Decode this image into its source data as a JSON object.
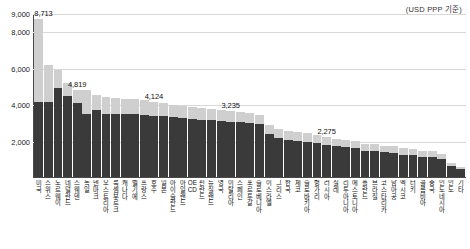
{
  "caption": {
    "unit_note": "(USD PPP 기준)"
  },
  "chart_data": {
    "type": "bar",
    "title": "",
    "subtitle": "",
    "xlabel": "",
    "ylabel": "",
    "unit_note": "(USD PPP 기준)",
    "stacked": true,
    "grid": true,
    "legend_position": "none",
    "ylim": [
      0,
      9000
    ],
    "yticks": [
      2000,
      4000,
      6000,
      8000,
      9000
    ],
    "ytick_labels": [
      "2,000",
      "4,000",
      "6,000",
      "8,000",
      "9,000"
    ],
    "colors": {
      "dark_segment": "#3a3a3a",
      "light_segment": "#cfcfcf",
      "gridline": "#d8d8d8",
      "axis": "#4a4a4a"
    },
    "series": [
      {
        "name": "dark",
        "values": [
          4130,
          4120,
          4900,
          4500,
          4100,
          3500,
          3720,
          3480,
          3460,
          3500,
          3490,
          3440,
          3380,
          3360,
          3300,
          3240,
          3180,
          3150,
          3140,
          3100,
          3050,
          3040,
          2980,
          2900,
          2400,
          2180,
          2050,
          2000,
          1960,
          1900,
          1790,
          1700,
          1640,
          1600,
          1450,
          1420,
          1360,
          1330,
          1240,
          1200,
          1130,
          1090,
          980,
          600,
          420
        ]
      },
      {
        "name": "light",
        "values": [
          4583,
          2080,
          1000,
          700,
          720,
          1319,
          800,
          940,
          910,
          820,
          800,
          790,
          744,
          720,
          700,
          680,
          660,
          640,
          620,
          600,
          580,
          560,
          540,
          520,
          500,
          490,
          470,
          460,
          450,
          440,
          430,
          420,
          410,
          400,
          390,
          380,
          370,
          360,
          350,
          340,
          330,
          320,
          300,
          180,
          120
        ]
      }
    ],
    "totals": [
      8713,
      6200,
      5900,
      5200,
      4819,
      4819,
      4520,
      4420,
      4370,
      4320,
      4290,
      4230,
      4124,
      4080,
      4000,
      3920,
      3840,
      3790,
      3760,
      3700,
      3630,
      3600,
      3520,
      3420,
      2900,
      2670,
      2520,
      2460,
      2410,
      2340,
      2275,
      2120,
      2050,
      2000,
      1840,
      1800,
      1730,
      1690,
      1590,
      1540,
      1460,
      1410,
      1280,
      780,
      540
    ],
    "value_labels": [
      {
        "index": 0,
        "text": "8,713"
      },
      {
        "index": 4,
        "text": "4,819"
      },
      {
        "index": 12,
        "text": "4,124"
      },
      {
        "index": 20,
        "text": "3,235"
      },
      {
        "index": 30,
        "text": "2,275"
      }
    ],
    "categories": [
      "미국",
      "스위스",
      "노르웨이",
      "네덜란드",
      "스웨덴",
      "독일",
      "덴마크",
      "오스트리아",
      "룩셈부르크",
      "캐나다",
      "벨기에",
      "프랑스",
      "호주",
      "일본",
      "아이슬란드",
      "아일랜드",
      "OECD",
      "핀란드",
      "뉴질랜드",
      "영국",
      "이탈리아",
      "스페인",
      "포르투갈",
      "슬로베니아",
      "이스라엘",
      "그리스",
      "한국",
      "체코",
      "슬로바키아",
      "헝가리",
      "러시아",
      "칠레",
      "리투아니아",
      "에스토니아",
      "폴란드",
      "브라질",
      "코스타리카",
      "남아공",
      "멕시코",
      "터키",
      "콜롬비아",
      "중국",
      "인도네시아",
      "인도",
      "기타"
    ]
  }
}
